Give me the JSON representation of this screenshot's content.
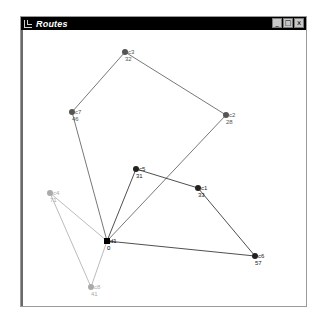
{
  "window": {
    "title": "Routes",
    "controls": {
      "minimize": "_",
      "maximize": "□",
      "close": "x"
    }
  },
  "colors": {
    "route_1": "#555555",
    "route_2": "#222222",
    "route_3": "#aaaaaa",
    "title_bar": "#000000",
    "canvas_bg": "#ffffff"
  },
  "nodes": [
    {
      "id": "c3",
      "demand": "32",
      "x": 123,
      "y": 52,
      "route": 1,
      "shape": "circle"
    },
    {
      "id": "c7",
      "demand": "46",
      "x": 70,
      "y": 112,
      "route": 1,
      "shape": "circle"
    },
    {
      "id": "c2",
      "demand": "28",
      "x": 224,
      "y": 115,
      "route": 1,
      "shape": "circle"
    },
    {
      "id": "c5",
      "demand": "31",
      "x": 134,
      "y": 169,
      "route": 2,
      "shape": "circle"
    },
    {
      "id": "c1",
      "demand": "33",
      "x": 196,
      "y": 188,
      "route": 2,
      "shape": "circle"
    },
    {
      "id": "c4",
      "demand": "71",
      "x": 48,
      "y": 193,
      "route": 3,
      "shape": "circle"
    },
    {
      "id": "d1",
      "demand": "0",
      "x": 105,
      "y": 241,
      "route": 0,
      "shape": "square"
    },
    {
      "id": "c6",
      "demand": "57",
      "x": 253,
      "y": 256,
      "route": 2,
      "shape": "circle"
    },
    {
      "id": "c8",
      "demand": "41",
      "x": 89,
      "y": 287,
      "route": 3,
      "shape": "circle"
    }
  ],
  "routes": [
    {
      "name": "route-1",
      "color": "#555555",
      "path": [
        "d1",
        "c7",
        "c3",
        "c2",
        "d1"
      ]
    },
    {
      "name": "route-2",
      "color": "#222222",
      "path": [
        "d1",
        "c5",
        "c1",
        "c6",
        "d1"
      ]
    },
    {
      "name": "route-3",
      "color": "#aaaaaa",
      "path": [
        "d1",
        "c4",
        "c8",
        "d1"
      ]
    }
  ]
}
